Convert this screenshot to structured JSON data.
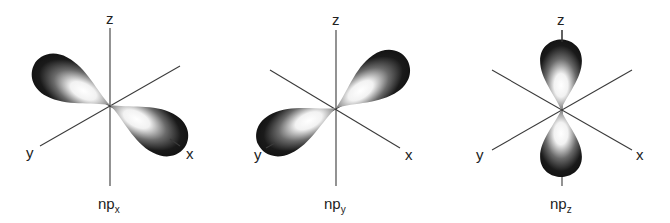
{
  "figure": {
    "panels": [
      {
        "id": "npx",
        "caption_main": "np",
        "caption_sub": "x",
        "axis_labels": {
          "z": "z",
          "y": "y",
          "x": "x"
        },
        "orientation": "along x axis"
      },
      {
        "id": "npy",
        "caption_main": "np",
        "caption_sub": "y",
        "axis_labels": {
          "z": "z",
          "y": "y",
          "x": "x"
        },
        "orientation": "along y axis"
      },
      {
        "id": "npz",
        "caption_main": "np",
        "caption_sub": "z",
        "axis_labels": {
          "z": "z",
          "y": "y",
          "x": "x"
        },
        "orientation": "along z axis"
      }
    ],
    "colors": {
      "lobe_dark": "#111111",
      "lobe_highlight": "#ffffff",
      "axis": "#3a3a3a",
      "background": "#ffffff"
    }
  }
}
